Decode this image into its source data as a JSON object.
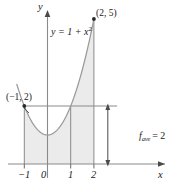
{
  "figure": {
    "colors": {
      "fill": "#ebebeb",
      "curve": "#8a8a8a",
      "axis": "#8a8a8a",
      "line": "#8a8a8a",
      "text": "#1a1a1a",
      "background": "#ffffff"
    },
    "axes": {
      "x_label": "x",
      "y_label": "y",
      "x_ticks": [
        "−1",
        "0",
        "1",
        "2"
      ],
      "x_tick_values": [
        -1,
        0,
        1,
        2
      ],
      "origin_label": "0"
    },
    "annotations": {
      "function_label_prefix": "y = 1 + x",
      "function_label_exponent": "2",
      "point_high_label": "(2, 5)",
      "point_left_label": "(−1, 2)",
      "average_label_prefix": "f",
      "average_label_subscript": "ave",
      "average_label_suffix": "= 2"
    }
  },
  "chart_data": {
    "type": "line",
    "title": "",
    "xlabel": "x",
    "ylabel": "y",
    "xlim": [
      -1.6,
      3.2
    ],
    "ylim": [
      -0.8,
      5.8
    ],
    "grid": false,
    "legend": "none",
    "function": "y = 1 + x^2",
    "series": [
      {
        "name": "y = 1 + x²",
        "x": [
          -1.4,
          -1.2,
          -1.0,
          -0.8,
          -0.6,
          -0.4,
          -0.2,
          0.0,
          0.2,
          0.4,
          0.6,
          0.8,
          1.0,
          1.2,
          1.4,
          1.6,
          1.8,
          2.0
        ],
        "values": [
          2.96,
          2.44,
          2.0,
          1.64,
          1.36,
          1.16,
          1.04,
          1.0,
          1.04,
          1.16,
          1.36,
          1.64,
          2.0,
          2.44,
          2.96,
          3.56,
          4.24,
          5.0
        ]
      },
      {
        "name": "f_ave = 2",
        "type": "horizontal-line",
        "y": 2,
        "x_from": -1.0,
        "x_to": 3.0
      }
    ],
    "shaded_region": {
      "label": "area under y = 1 + x²",
      "x_from": -1,
      "x_to": 2,
      "fill": "#ebebeb"
    },
    "points": [
      {
        "label": "(2, 5)",
        "x": 2,
        "y": 5
      },
      {
        "label": "(−1, 2)",
        "x": -1,
        "y": 2
      }
    ],
    "vertical_lines": [
      {
        "x": -1,
        "y_from": 0,
        "y_to": 2
      },
      {
        "x": 1,
        "y_from": 0,
        "y_to": 2
      },
      {
        "x": 2,
        "y_from": 0,
        "y_to": 5
      }
    ],
    "measure_arrow": {
      "label": "f_ave = 2",
      "x": 2.6,
      "y_from": 0,
      "y_to": 2,
      "value": 2
    },
    "xticks": [
      -1,
      0,
      1,
      2
    ],
    "xticklabels": [
      "−1",
      "0",
      "1",
      "2"
    ]
  }
}
